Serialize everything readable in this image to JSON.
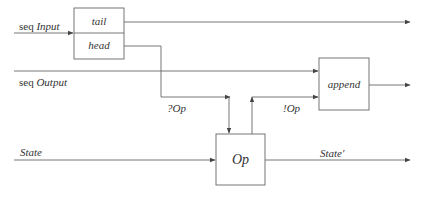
{
  "diagram": {
    "type": "dataflow",
    "colors": {
      "line": "#666666",
      "text": "#333333",
      "background": "#ffffff"
    },
    "boxes": [
      {
        "id": "tail",
        "label": "tail"
      },
      {
        "id": "head",
        "label": "head"
      },
      {
        "id": "append",
        "label": "append"
      },
      {
        "id": "op",
        "label": "Op"
      }
    ],
    "inputs": {
      "seq_input": {
        "prefix": "seq",
        "name": "Input"
      },
      "seq_output": {
        "prefix": "seq",
        "name": "Output"
      },
      "state": {
        "name": "State"
      }
    },
    "edge_labels": {
      "in_op": "?Op",
      "out_op": "!Op",
      "state_prime": "State′"
    },
    "edges": [
      {
        "from": "seq Input",
        "to": "tail/head"
      },
      {
        "from": "tail",
        "to": "output-right"
      },
      {
        "from": "head",
        "to": "Op",
        "label": "?Op"
      },
      {
        "from": "seq Output",
        "to": "append"
      },
      {
        "from": "Op",
        "to": "append",
        "label": "!Op"
      },
      {
        "from": "append",
        "to": "output-right"
      },
      {
        "from": "State",
        "to": "Op"
      },
      {
        "from": "Op",
        "to": "output-right",
        "label": "State′"
      }
    ]
  }
}
